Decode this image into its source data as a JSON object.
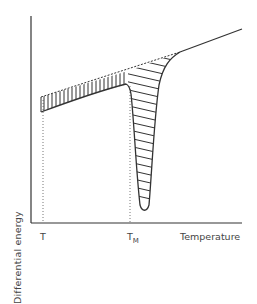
{
  "figure": {
    "ylabel": "Differential energy",
    "xlabel": "Temperature",
    "ticks": {
      "t": "T",
      "tm_main": "T",
      "tm_sub": "M"
    },
    "colors": {
      "line": "#333333",
      "dotted": "#777777",
      "text": "#444444",
      "background": "#ffffff"
    }
  }
}
